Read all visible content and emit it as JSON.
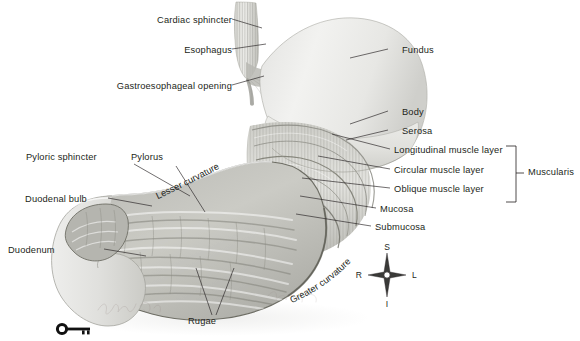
{
  "figure": {
    "background_color": "#ffffff",
    "label_color": "#231f20",
    "signature": "artist signature"
  },
  "labels_left": [
    {
      "id": "cardiac-sphincter",
      "text": "Cardiac sphincter",
      "x": 228,
      "y": 22
    },
    {
      "id": "esophagus",
      "text": "Esophagus",
      "x": 228,
      "y": 52
    },
    {
      "id": "gastroesophageal-opening",
      "text": "Gastroesophageal opening",
      "x": 228,
      "y": 88
    },
    {
      "id": "pyloric-sphincter",
      "text": "Pyloric sphincter",
      "x": 118,
      "y": 158
    },
    {
      "id": "pylorus",
      "text": "Pylorus",
      "x": 160,
      "y": 158
    },
    {
      "id": "duodenal-bulb",
      "text": "Duodenal bulb",
      "x": 40,
      "y": 200
    },
    {
      "id": "duodenum",
      "text": "Duodenum",
      "x": 44,
      "y": 251
    },
    {
      "id": "rugae",
      "text": "Rugae",
      "x": 207,
      "y": 322
    }
  ],
  "labels_right": [
    {
      "id": "fundus",
      "text": "Fundus",
      "x": 402,
      "y": 52
    },
    {
      "id": "body",
      "text": "Body",
      "x": 402,
      "y": 114
    },
    {
      "id": "serosa",
      "text": "Serosa",
      "x": 402,
      "y": 133
    },
    {
      "id": "longitudinal-muscle-layer",
      "text": "Longitudinal muscle layer",
      "x": 394,
      "y": 152
    },
    {
      "id": "circular-muscle-layer",
      "text": "Circular muscle layer",
      "x": 394,
      "y": 172
    },
    {
      "id": "oblique-muscle-layer",
      "text": "Oblique muscle layer",
      "x": 394,
      "y": 191
    },
    {
      "id": "mucosa",
      "text": "Mucosa",
      "x": 380,
      "y": 211
    },
    {
      "id": "submucosa",
      "text": "Submucosa",
      "x": 375,
      "y": 229
    }
  ],
  "bracket": {
    "id": "muscularis-bracket",
    "label": "Muscularis",
    "label_x": 528,
    "label_y": 173,
    "x": 516,
    "y_top": 146,
    "y_bottom": 202
  },
  "curved_labels": [
    {
      "id": "lesser-curvature",
      "text": "Lesser curvature"
    },
    {
      "id": "greater-curvature",
      "text": "Greater curvature"
    }
  ],
  "orientation_compass": {
    "id": "orientation-compass",
    "center_x": 387,
    "center_y": 275,
    "superior": "S",
    "inferior": "I",
    "right": "R",
    "left": "L"
  },
  "key_icon": {
    "id": "key-icon",
    "x": 58,
    "y": 327
  }
}
